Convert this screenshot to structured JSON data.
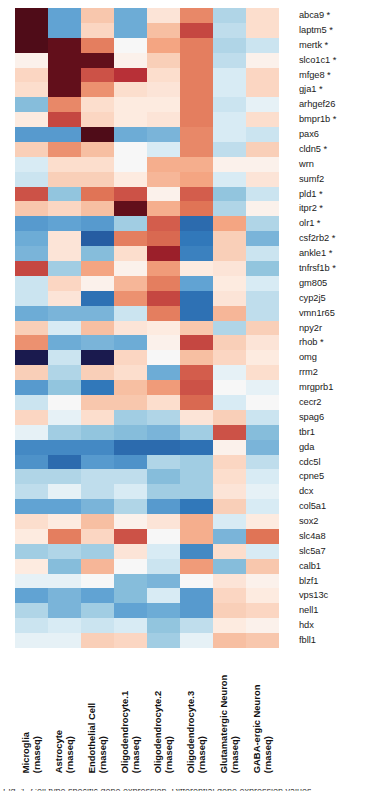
{
  "figure": {
    "type": "heatmap",
    "caption_partial": "Fig. 1. Cell type specific gene expression. Differential gene expression values"
  },
  "colors": {
    "high_positive": "#67001f",
    "positive": "#b2182b",
    "mid_positive": "#f4a582",
    "neutral": "#f7f7f7",
    "mid_negative": "#92c5de",
    "negative": "#2166ac",
    "high_negative": "#1a1a4e",
    "text": "#1b1b1b",
    "background": "#ffffff"
  },
  "chart_data": {
    "type": "heatmap",
    "title": "",
    "xlabel": "",
    "ylabel": "",
    "colormap": "RdBu_r",
    "vmin": -3,
    "vmax": 3,
    "grid": false,
    "legend": "none",
    "columns": [
      {
        "line1": "Microglia",
        "line2": "(rnaseq)"
      },
      {
        "line1": "Astrocyte",
        "line2": "(rnaseq)"
      },
      {
        "line1": "Endothelial Cell",
        "line2": "(rnaseq)"
      },
      {
        "line1": "Oligodendrocyte.1",
        "line2": "(rnaseq)"
      },
      {
        "line1": "Oligodendrocyte.2",
        "line2": "(rnaseq)"
      },
      {
        "line1": "Oligodendrocyte.3",
        "line2": "(rnaseq)"
      },
      {
        "line1": "Glutamatergic Neuron",
        "line2": "(rnaseq)"
      },
      {
        "line1": "GABA-ergic Neuron",
        "line2": "(rnaseq)"
      }
    ],
    "rows": [
      "abca9 *",
      "laptm5 *",
      "mertk *",
      "slco1c1 *",
      "mfge8 *",
      "gja1 *",
      "arhgef26",
      "bmpr1b *",
      "pax6",
      "cldn5 *",
      "wrn",
      "sumf2",
      "pld1 *",
      "itpr2 *",
      "olr1 *",
      "csf2rb2 *",
      "ankle1 *",
      "tnfrsf1b *",
      "gm805",
      "cyp2j5",
      "vmn1r65",
      "npy2r",
      "rhob *",
      "omg",
      "rrm2",
      "mrgprb1",
      "cecr2",
      "spag6",
      "tbr1",
      "gda",
      "cdc5l",
      "cpne5",
      "dcx",
      "col5a1",
      "sox2",
      "slc4a8",
      "slc5a7",
      "calb1",
      "blzf1",
      "vps13c",
      "nell1",
      "hdx",
      "fbll1"
    ],
    "values": [
      [
        3.0,
        -1.1,
        0.7,
        -1.0,
        0.3,
        1.4,
        -0.5,
        0.4
      ],
      [
        3.0,
        -1.1,
        0.5,
        -1.0,
        0.8,
        2.0,
        -0.4,
        0.4
      ],
      [
        3.0,
        2.9,
        1.5,
        0.0,
        1.1,
        1.5,
        -0.5,
        -0.3
      ],
      [
        0.1,
        2.9,
        2.9,
        0.1,
        0.6,
        1.5,
        -0.4,
        0.1
      ],
      [
        0.5,
        2.9,
        1.9,
        2.2,
        0.4,
        1.5,
        -0.2,
        0.5
      ],
      [
        0.4,
        2.9,
        1.3,
        0.4,
        0.3,
        1.5,
        -0.2,
        0.5
      ],
      [
        -0.8,
        1.4,
        0.4,
        0.2,
        0.2,
        1.5,
        -0.3,
        -0.1
      ],
      [
        0.2,
        2.0,
        0.5,
        0.2,
        0.3,
        1.5,
        -0.2,
        0.4
      ],
      [
        -1.2,
        -1.2,
        3.0,
        -1.0,
        -0.9,
        1.4,
        -0.2,
        -0.3
      ],
      [
        0.6,
        1.3,
        0.8,
        0.0,
        -0.2,
        1.4,
        -0.4,
        0.6
      ],
      [
        -0.2,
        0.4,
        0.4,
        0.0,
        1.0,
        1.0,
        0.1,
        0.1
      ],
      [
        -0.3,
        0.6,
        0.6,
        0.2,
        0.9,
        1.1,
        -0.2,
        0.3
      ],
      [
        1.9,
        -0.7,
        1.6,
        1.9,
        0.1,
        1.8,
        -0.7,
        -0.3
      ],
      [
        0.7,
        0.5,
        0.8,
        2.9,
        1.0,
        1.6,
        -0.5,
        0.1
      ],
      [
        -1.2,
        -1.1,
        -1.2,
        -0.6,
        1.8,
        -1.8,
        1.1,
        -0.5
      ],
      [
        -1.0,
        0.3,
        -2.0,
        1.5,
        1.7,
        -1.6,
        0.6,
        -0.9
      ],
      [
        -0.9,
        0.3,
        -0.8,
        0.4,
        2.5,
        -1.5,
        0.6,
        -0.3
      ],
      [
        2.0,
        -0.6,
        1.1,
        0.1,
        1.2,
        0.2,
        0.3,
        -0.7
      ],
      [
        -0.3,
        0.5,
        0.1,
        0.9,
        1.5,
        -1.1,
        0.2,
        -0.2
      ],
      [
        -0.3,
        0.3,
        -1.7,
        1.3,
        2.0,
        -1.7,
        0.3,
        -0.4
      ],
      [
        -1.0,
        -0.9,
        -0.9,
        -0.3,
        1.5,
        -1.7,
        0.9,
        -0.4
      ],
      [
        0.6,
        -0.2,
        0.8,
        0.3,
        0.2,
        0.7,
        -0.5,
        0.6
      ],
      [
        1.3,
        -1.0,
        -0.9,
        -1.0,
        0.1,
        2.0,
        0.6,
        0.3
      ],
      [
        -3.0,
        -0.3,
        -3.0,
        0.5,
        0.0,
        0.8,
        0.5,
        0.2
      ],
      [
        0.6,
        -0.5,
        0.6,
        0.4,
        -1.0,
        1.8,
        -0.1,
        0.4
      ],
      [
        -1.2,
        -0.7,
        -1.6,
        0.8,
        1.2,
        1.9,
        0.0,
        -0.1
      ],
      [
        -0.3,
        0.0,
        0.7,
        0.7,
        0.4,
        1.7,
        -0.2,
        0.0
      ],
      [
        0.5,
        -0.1,
        0.4,
        -0.6,
        -0.5,
        0.3,
        0.6,
        -0.3
      ],
      [
        -0.1,
        -0.6,
        -0.7,
        -0.8,
        -0.9,
        -0.6,
        1.9,
        -0.8
      ],
      [
        -1.4,
        -1.4,
        -1.4,
        -1.8,
        -1.8,
        -1.7,
        0.1,
        -0.9
      ],
      [
        -1.3,
        -1.8,
        -1.2,
        -1.3,
        -0.5,
        -0.6,
        0.5,
        -0.4
      ],
      [
        -0.5,
        -0.5,
        -0.4,
        -0.4,
        -0.8,
        -0.6,
        0.4,
        -0.2
      ],
      [
        -0.4,
        -0.1,
        -0.4,
        -0.2,
        -0.6,
        -0.6,
        0.3,
        -0.1
      ],
      [
        -1.1,
        -1.1,
        -0.9,
        -0.5,
        -1.2,
        -1.6,
        0.6,
        -0.2
      ],
      [
        0.4,
        0.2,
        0.8,
        0.1,
        0.3,
        1.0,
        -0.2,
        0.2
      ],
      [
        0.2,
        1.5,
        0.5,
        1.9,
        0.0,
        1.0,
        -0.9,
        1.6
      ],
      [
        -0.6,
        -0.5,
        -0.6,
        0.3,
        -0.2,
        -1.4,
        0.4,
        -0.2
      ],
      [
        0.2,
        -0.8,
        0.9,
        0.0,
        -0.3,
        1.2,
        -0.8,
        0.7
      ],
      [
        -0.1,
        -0.1,
        0.0,
        -0.8,
        -0.9,
        0.0,
        0.3,
        0.1
      ],
      [
        -1.1,
        -0.9,
        -1.1,
        -0.8,
        -0.2,
        -1.2,
        0.5,
        0.2
      ],
      [
        -0.5,
        -0.9,
        -0.6,
        -1.1,
        -1.0,
        -1.2,
        0.6,
        0.5
      ],
      [
        -0.3,
        -0.2,
        -0.3,
        -0.2,
        -0.7,
        -0.4,
        0.2,
        0.1
      ],
      [
        -0.1,
        -0.1,
        0.6,
        0.5,
        -0.6,
        -0.1,
        0.8,
        0.7
      ]
    ]
  }
}
